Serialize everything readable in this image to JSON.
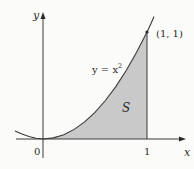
{
  "figure": {
    "axes": {
      "x_label": "x",
      "y_label": "y",
      "origin_label": "0",
      "x_tick_label": "1"
    },
    "curve": {
      "equation_label_prefix": "y = x",
      "equation_label_exponent": "2",
      "function": "x^2"
    },
    "point": {
      "label": "(1, 1)"
    },
    "region": {
      "label": "S",
      "description": "area under y = x^2 from x = 0 to x = 1"
    },
    "colors": {
      "shade": "#c9c9c9",
      "line": "#3a3a3a",
      "background": "#fbfbfa"
    }
  }
}
